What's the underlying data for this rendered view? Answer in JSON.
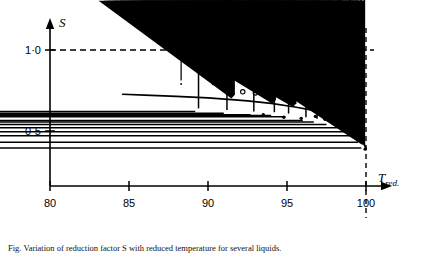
{
  "figure": {
    "title": "",
    "caption": "Fig. Variation of reduction factor S with reduced temperature for several liquids."
  },
  "axes": {
    "y_axis_title": "S",
    "x_axis_title_main": "T",
    "x_axis_title_sub": "red.",
    "y_ticks": [
      {
        "value": 0.5,
        "label": "0·5"
      },
      {
        "value": 1.0,
        "label": "1·0"
      }
    ],
    "x_ticks": [
      {
        "value": 80,
        "label": "80"
      },
      {
        "value": 85,
        "label": "85"
      },
      {
        "value": 90,
        "label": "90"
      },
      {
        "value": 95,
        "label": "95"
      },
      {
        "value": 100,
        "label": "100"
      }
    ]
  },
  "chart_data": {
    "type": "scatter",
    "title": "",
    "xlabel": "T_red.",
    "ylabel": "S",
    "xlim": [
      80,
      100.8
    ],
    "ylim": [
      0.28,
      1.08
    ],
    "grid": false,
    "legend": "none",
    "reference_lines": [
      {
        "name": "unity-reference-line",
        "orientation": "horizontal",
        "value": 1.0,
        "style": "dashed"
      },
      {
        "name": "critical-temperature-line",
        "orientation": "vertical",
        "value": 100,
        "style": "dashed"
      }
    ],
    "fit_curve": {
      "name": "fitted-trend-curve",
      "style": "solid",
      "x": [
        84.6,
        86,
        88,
        90,
        91.5,
        92.5,
        94,
        95.5,
        96.5,
        97.5,
        98.3,
        99.0,
        99.5,
        99.8,
        100.0
      ],
      "y": [
        0.727,
        0.722,
        0.714,
        0.704,
        0.694,
        0.686,
        0.67,
        0.648,
        0.63,
        0.604,
        0.575,
        0.535,
        0.487,
        0.44,
        0.39
      ]
    },
    "series": [
      {
        "name": "diamond-markers",
        "marker": "diamond",
        "points": [
          {
            "x": 88.3,
            "y": 0.79
          },
          {
            "x": 90.3,
            "y": 0.788
          },
          {
            "x": 91.6,
            "y": 0.765
          },
          {
            "x": 92.6,
            "y": 0.772
          },
          {
            "x": 93.4,
            "y": 0.745
          },
          {
            "x": 94.4,
            "y": 0.757
          },
          {
            "x": 95.9,
            "y": 0.71
          },
          {
            "x": 96.7,
            "y": 0.722
          },
          {
            "x": 97.5,
            "y": 0.69
          },
          {
            "x": 98.3,
            "y": 0.672
          },
          {
            "x": 99.0,
            "y": 0.648
          }
        ]
      },
      {
        "name": "circle-markers",
        "marker": "circle",
        "points": [
          {
            "x": 91.0,
            "y": 0.76
          },
          {
            "x": 92.2,
            "y": 0.742
          },
          {
            "x": 93.0,
            "y": 0.735
          },
          {
            "x": 93.8,
            "y": 0.73
          },
          {
            "x": 95.0,
            "y": 0.712
          },
          {
            "x": 95.7,
            "y": 0.7
          },
          {
            "x": 96.4,
            "y": 0.698
          },
          {
            "x": 97.2,
            "y": 0.676
          },
          {
            "x": 97.9,
            "y": 0.664
          },
          {
            "x": 98.6,
            "y": 0.64
          },
          {
            "x": 99.2,
            "y": 0.618
          },
          {
            "x": 99.6,
            "y": 0.58
          }
        ]
      },
      {
        "name": "plus-markers",
        "marker": "plus",
        "points": [
          {
            "x": 89.4,
            "y": 0.62
          },
          {
            "x": 91.2,
            "y": 0.61
          },
          {
            "x": 92.9,
            "y": 0.6
          },
          {
            "x": 94.2,
            "y": 0.596
          },
          {
            "x": 95.1,
            "y": 0.588
          },
          {
            "x": 96.2,
            "y": 0.565
          },
          {
            "x": 96.9,
            "y": 0.556
          },
          {
            "x": 97.7,
            "y": 0.54
          },
          {
            "x": 98.4,
            "y": 0.52
          },
          {
            "x": 99.0,
            "y": 0.495
          },
          {
            "x": 99.4,
            "y": 0.47
          },
          {
            "x": 99.7,
            "y": 0.43
          },
          {
            "x": 99.9,
            "y": 0.395
          }
        ]
      },
      {
        "name": "triangle-markers",
        "marker": "triangle",
        "points": [
          {
            "x": 91.7,
            "y": 0.7
          },
          {
            "x": 94.3,
            "y": 0.668
          },
          {
            "x": 95.6,
            "y": 0.648
          },
          {
            "x": 97.2,
            "y": 0.612
          },
          {
            "x": 98.5,
            "y": 0.568
          },
          {
            "x": 99.3,
            "y": 0.51
          },
          {
            "x": 99.7,
            "y": 0.455
          },
          {
            "x": 99.9,
            "y": 0.42
          }
        ]
      },
      {
        "name": "filled-dot-markers",
        "marker": "dot",
        "points": [
          {
            "x": 93.5,
            "y": 0.6
          },
          {
            "x": 94.8,
            "y": 0.585
          },
          {
            "x": 95.9,
            "y": 0.578
          },
          {
            "x": 96.8,
            "y": 0.59
          },
          {
            "x": 97.4,
            "y": 0.572
          },
          {
            "x": 98.0,
            "y": 0.556
          },
          {
            "x": 98.6,
            "y": 0.536
          },
          {
            "x": 99.1,
            "y": 0.505
          },
          {
            "x": 99.5,
            "y": 0.468
          },
          {
            "x": 99.8,
            "y": 0.425
          },
          {
            "x": 99.95,
            "y": 0.388
          }
        ]
      }
    ]
  }
}
